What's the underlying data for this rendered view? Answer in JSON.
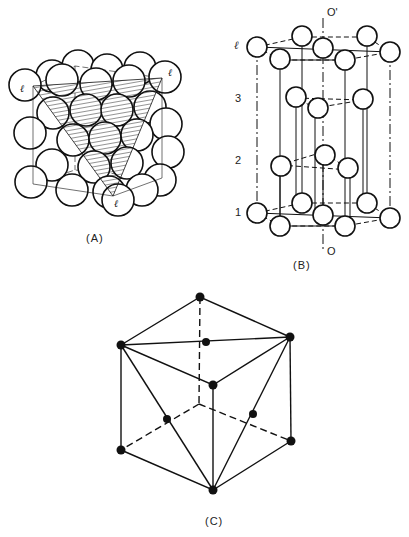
{
  "figure": {
    "panels": [
      {
        "id": "A",
        "caption": "(A)",
        "description": "Close-packed spheres in an FCC cube with hatched (111) plane",
        "plane_markers": [
          "ℓ",
          "ℓ",
          "ℓ"
        ]
      },
      {
        "id": "B",
        "caption": "(B)",
        "description": "Hexagonal stacking layers along axis O–O'",
        "axis_top": "O'",
        "axis_bottom": "O",
        "layers": [
          "ℓ",
          "3",
          "2",
          "1"
        ]
      },
      {
        "id": "C",
        "caption": "(C)",
        "description": "Cube with atoms at corners and face centers, triangular (111) plane"
      }
    ]
  },
  "colors": {
    "ink": "#111111",
    "background": "#ffffff"
  }
}
